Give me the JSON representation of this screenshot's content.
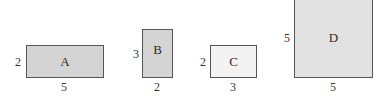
{
  "diagram": {
    "rectangles": [
      {
        "id": "A",
        "label": "A",
        "width_label": "5",
        "height_label": "2",
        "fill": "#d4d4d4"
      },
      {
        "id": "B",
        "label": "B",
        "width_label": "2",
        "height_label": "3",
        "fill": "#d4d4d4"
      },
      {
        "id": "C",
        "label": "C",
        "width_label": "3",
        "height_label": "2",
        "fill": "#f3f3f3"
      },
      {
        "id": "D",
        "label": "D",
        "width_label": "5",
        "height_label": "5",
        "fill": "#e2e2e2"
      }
    ],
    "border_color": "#555555"
  }
}
